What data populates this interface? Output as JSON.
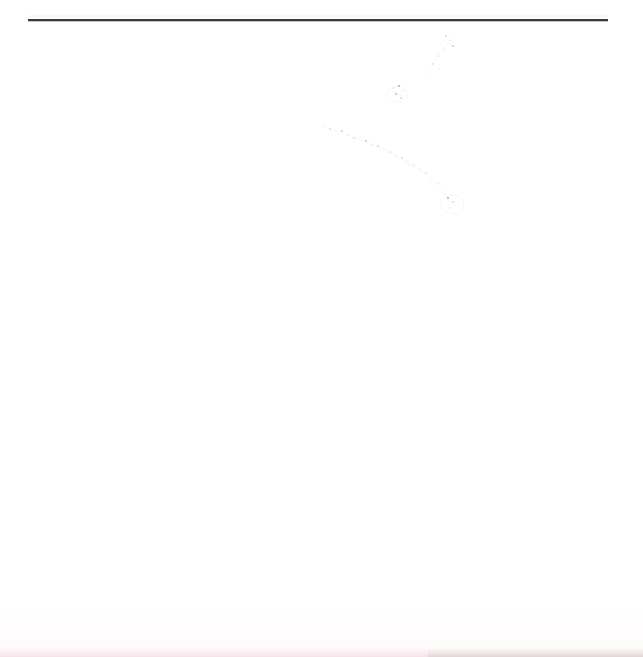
{
  "document": {
    "kind": "scanned-page",
    "page_background_color": "#ffffff",
    "ink_color": "#3a3a3c",
    "body_text": "",
    "notes_text": ""
  },
  "rule": {
    "label": "horizontal-rule",
    "color": "#3a3a3c",
    "x_start": 28,
    "x_end": 608,
    "y": 19,
    "thickness_px": 2
  },
  "artifacts": {
    "diagonal_streak": {
      "label": "diagonal-speckle-streak",
      "description": "faint illegible diagonal smudge of scan speckles",
      "color": "#7a7a86",
      "from_x": 445,
      "from_y": 35,
      "to_x": 460,
      "to_y": 215
    },
    "bottom_edge_tint": {
      "label": "bottom-edge-tint",
      "left_color": "#f3cedd",
      "right_color": "#cdcac1"
    }
  }
}
